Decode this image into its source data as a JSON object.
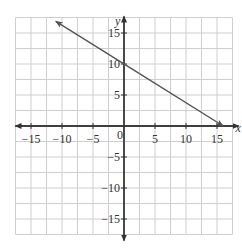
{
  "chart_data": {
    "type": "line",
    "title": "",
    "xlabel": "x",
    "ylabel": "y",
    "xlim": [
      -17.5,
      17.5
    ],
    "ylim": [
      -17.5,
      17.5
    ],
    "grid": true,
    "grid_step": 2.5,
    "x_ticks": [
      -15,
      -10,
      -5,
      0,
      5,
      10,
      15
    ],
    "y_ticks": [
      -15,
      -10,
      -5,
      5,
      10,
      15
    ],
    "x_tick_labels": [
      "−15",
      "−10",
      "−5",
      "0",
      "5",
      "10",
      "15"
    ],
    "y_tick_labels": [
      "−15",
      "−10",
      "−5",
      "5",
      "10",
      "15"
    ],
    "series": [
      {
        "name": "line",
        "equation": "y = -5/8 x + 10",
        "slope": -0.625,
        "intercept": 10,
        "x": [
          -11,
          16
        ],
        "y": [
          16.875,
          0
        ],
        "arrows": "both",
        "color": "#555555"
      }
    ],
    "legend": null
  },
  "colors": {
    "grid": "#cfcfcf",
    "axis": "#333333",
    "line": "#555555"
  }
}
